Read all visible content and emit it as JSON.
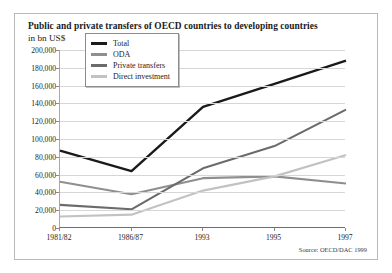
{
  "figure": {
    "title": "Public and private transfers of OECD countries to developing countries",
    "subtitle": "in bn US$",
    "source": "Source: OECD/DAC 1999"
  },
  "chart_data": {
    "type": "line",
    "title": "Public and private transfers of OECD countries to developing countries",
    "subtitle": "in bn US$",
    "xlabel": "",
    "ylabel": "in bn US$",
    "categories": [
      "1981/82",
      "1986/87",
      "1993",
      "1995",
      "1997"
    ],
    "ylim": [
      0,
      200000
    ],
    "ytick_step": 20000,
    "ytick_labels": [
      "0",
      "20,000",
      "40,000",
      "60,000",
      "80,000",
      "100,000",
      "120,000",
      "140,000",
      "160,000",
      "180,000",
      "200,000"
    ],
    "ytick_values": [
      0,
      20000,
      40000,
      60000,
      80000,
      100000,
      120000,
      140000,
      160000,
      180000,
      200000
    ],
    "grid": true,
    "legend_position": "top-left-inside",
    "series": [
      {
        "name": "Total",
        "color": "#1a1a1a",
        "values": [
          87000,
          64000,
          136000,
          162000,
          188000
        ]
      },
      {
        "name": "ODA",
        "color": "#8f8f8f",
        "values": [
          52000,
          38000,
          56000,
          58000,
          50000
        ]
      },
      {
        "name": "Private transfers",
        "color": "#6b6b6b",
        "values": [
          26000,
          21000,
          67000,
          92000,
          133000
        ]
      },
      {
        "name": "Direct investment",
        "color": "#c2c2c2",
        "values": [
          13000,
          15000,
          42000,
          58000,
          82000
        ]
      }
    ],
    "source": "Source: OECD/DAC 1999"
  }
}
